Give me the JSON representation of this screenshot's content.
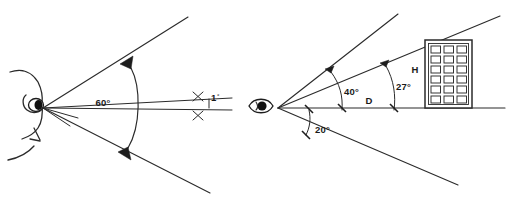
{
  "figure": {
    "background_color": "#ffffff",
    "ink_color": "#2b2b2b",
    "panels": [
      {
        "id": "left",
        "name": "plan-view-visual-field",
        "description": "Side profile of a human head with visual field cone",
        "angles": [
          {
            "name": "total-visual-field",
            "label": "60°",
            "value": 60,
            "unit": "degrees"
          },
          {
            "name": "foveal-cone",
            "label": "1",
            "degree_symbol": "°",
            "value": 1,
            "unit": "degrees"
          }
        ]
      },
      {
        "id": "right",
        "name": "building-viewing-geometry",
        "description": "Eye viewing a multi-storey building showing elevation angles",
        "angles": [
          {
            "name": "upper-field-angle",
            "label": "40°",
            "value": 40,
            "unit": "degrees"
          },
          {
            "name": "building-subtended-angle",
            "label": "27°",
            "value": 27,
            "unit": "degrees"
          },
          {
            "name": "lower-field-angle",
            "label": "20°",
            "value": 20,
            "unit": "degrees"
          }
        ],
        "dimensions": [
          {
            "name": "building-height",
            "label": "H"
          },
          {
            "name": "viewing-distance",
            "label": "D"
          }
        ],
        "building": {
          "name": "building",
          "window_columns": 3,
          "window_rows": 6
        }
      }
    ]
  },
  "labels": {
    "angle_60": "60°",
    "angle_1": "1",
    "degree_mark": "°",
    "angle_40": "40°",
    "angle_27": "27°",
    "angle_20": "20°",
    "height_H": "H",
    "distance_D": "D"
  }
}
